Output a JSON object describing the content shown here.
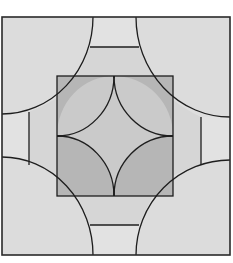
{
  "diagram": {
    "title": "",
    "type": "quilt-block",
    "colors": {
      "background": "#ffffff",
      "frame_fill": "#dedede",
      "corner_circles": "#dcdcdc",
      "outer_strips": "#e2e2e2",
      "inner_strips": "#d6d6d6",
      "inner_quarters": "#b6b6b6",
      "center_star": "#cacaca",
      "line": "#1e1e1e"
    },
    "geometry": {
      "frame": {
        "x1": 2,
        "y1": 17,
        "x2": 230,
        "y2": 255
      },
      "corner_radius_x": 91,
      "corner_radius_y": 97,
      "inner_square": {
        "x1": 57,
        "y1": 76,
        "x2": 173,
        "y2": 196
      },
      "center": {
        "x": 114,
        "y": 136
      }
    },
    "pieces": [
      {
        "name": "corner-circle-top-left"
      },
      {
        "name": "corner-circle-top-right"
      },
      {
        "name": "corner-circle-bottom-left"
      },
      {
        "name": "corner-circle-bottom-right"
      },
      {
        "name": "strip-top-outer"
      },
      {
        "name": "strip-top-inner"
      },
      {
        "name": "strip-bottom-outer"
      },
      {
        "name": "strip-bottom-inner"
      },
      {
        "name": "strip-left-outer"
      },
      {
        "name": "strip-left-inner"
      },
      {
        "name": "strip-right-outer"
      },
      {
        "name": "strip-right-inner"
      },
      {
        "name": "inner-quarter-top-left"
      },
      {
        "name": "inner-quarter-top-right"
      },
      {
        "name": "inner-quarter-bottom-left"
      },
      {
        "name": "inner-quarter-bottom-right"
      },
      {
        "name": "center-star"
      }
    ]
  }
}
